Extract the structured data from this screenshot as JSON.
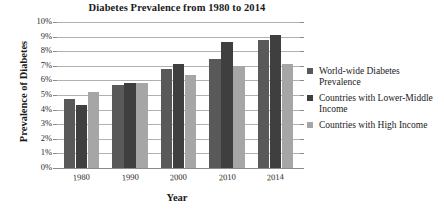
{
  "chart_data": {
    "type": "bar",
    "title": "Diabetes Prevalence from 1980 to 2014",
    "xlabel": "Year",
    "ylabel": "Prevalence of Diabetes",
    "categories": [
      "1980",
      "1990",
      "2000",
      "2010",
      "2014"
    ],
    "ylim": [
      0,
      10
    ],
    "ytick_labels": [
      "0%",
      "1%",
      "2%",
      "3%",
      "4%",
      "5%",
      "6%",
      "7%",
      "8%",
      "9%",
      "10%"
    ],
    "ytick_values": [
      0,
      1,
      2,
      3,
      4,
      5,
      6,
      7,
      8,
      9,
      10
    ],
    "grid": true,
    "legend_position": "right",
    "series": [
      {
        "name": "World-wide Diabetes Prevalence",
        "color": "#595959",
        "values": [
          4.7,
          5.7,
          6.8,
          7.5,
          8.8
        ]
      },
      {
        "name": "Countries with Lower-Middle Income",
        "color": "#3f3f3f",
        "values": [
          4.3,
          5.8,
          7.1,
          8.6,
          9.1
        ]
      },
      {
        "name": "Countries with High Income",
        "color": "#a6a6a6",
        "values": [
          5.2,
          5.8,
          6.4,
          7.0,
          7.1
        ]
      }
    ]
  }
}
